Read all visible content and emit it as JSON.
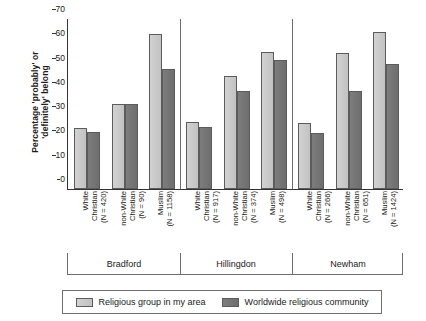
{
  "chart_data": {
    "type": "bar",
    "title": "",
    "xlabel": "",
    "ylabel": "Percentage 'probably' or\n'definitely' belong",
    "ylim": [
      0,
      70
    ],
    "yticks": [
      0,
      10,
      20,
      30,
      40,
      50,
      60,
      70
    ],
    "grid": false,
    "legend_position": "bottom",
    "groups": [
      {
        "name": "Bradford",
        "categories": [
          {
            "label": "White\nChristian",
            "n_label": "(N = 420)",
            "n": 420
          },
          {
            "label": "non-White\nChristian",
            "n_label": "(N = 90)",
            "n": 90
          },
          {
            "label": "Muslim",
            "n_label": "(N = 1158)",
            "n": 1158
          }
        ]
      },
      {
        "name": "Hillingdon",
        "categories": [
          {
            "label": "White\nChristian",
            "n_label": "(N = 917)",
            "n": 917
          },
          {
            "label": "non-White\nChristian",
            "n_label": "(N = 374)",
            "n": 374
          },
          {
            "label": "Muslim",
            "n_label": "(N = 498)",
            "n": 498
          }
        ]
      },
      {
        "name": "Newham",
        "categories": [
          {
            "label": "White\nChristian",
            "n_label": "(N = 266)",
            "n": 266
          },
          {
            "label": "non-White\nChristian",
            "n_label": "(N = 651)",
            "n": 651
          },
          {
            "label": "Muslim",
            "n_label": "(N = 1424)",
            "n": 1424
          }
        ]
      }
    ],
    "categories": [
      "Bradford / White Christian (N = 420)",
      "Bradford / non-White Christian (N = 90)",
      "Bradford / Muslim (N = 1158)",
      "Hillingdon / White Christian (N = 917)",
      "Hillingdon / non-White Christian (N = 374)",
      "Hillingdon / Muslim (N = 498)",
      "Newham / White Christian (N = 266)",
      "Newham / non-White Christian (N = 651)",
      "Newham / Muslim (N = 1424)"
    ],
    "series": [
      {
        "name": "Religious group in my area",
        "color": "#cccccc",
        "values": [
          25,
          35,
          64,
          27.5,
          46.5,
          56.5,
          27,
          56,
          64.5
        ]
      },
      {
        "name": "Worldwide religious community",
        "color": "#757575",
        "values": [
          23.5,
          35,
          49.5,
          25.5,
          40.5,
          53,
          23,
          40.5,
          51.5
        ]
      }
    ]
  },
  "legend": {
    "items": [
      {
        "label": "Religious group in my area",
        "swatch": "light"
      },
      {
        "label": "Worldwide religious community",
        "swatch": "dark"
      }
    ]
  },
  "colors": {
    "light_bar": "#cccccc",
    "dark_bar": "#757575",
    "axis": "#333333",
    "frame": "#6f6f6f"
  }
}
